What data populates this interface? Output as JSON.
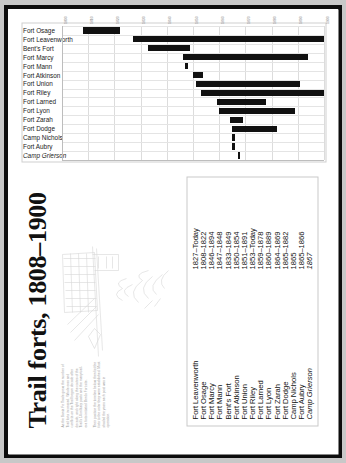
{
  "document": {
    "title": "Trail forts, 1808–1900",
    "blurb": [
      "As the Santa Fe Trade grew, the number of Trail forts increased. Whole eras and conflicts on the Trail began decade after decade, and right along the routes of the Trail's 14 military posts and the many trail-era forts initiated Bent's Fort site.",
      "Their position the timeline below, then list the forts to the order they were established. Most shaded the years each post was in operation."
    ]
  },
  "legend": {
    "rows": [
      {
        "name": "Fort Leavenworth",
        "dates": "1827–Today",
        "italic": false
      },
      {
        "name": "Fort Osage",
        "dates": "1808–1822",
        "italic": false
      },
      {
        "name": "Fort Marcy",
        "dates": "1846–1894",
        "italic": false
      },
      {
        "name": "Fort Mann",
        "dates": "1847–1848",
        "italic": false
      },
      {
        "name": "Bent's Fort",
        "dates": "1833–1849",
        "italic": false
      },
      {
        "name": "Fort Atkinson",
        "dates": "1850–1854",
        "italic": false
      },
      {
        "name": "Fort Union",
        "dates": "1851–1891",
        "italic": false
      },
      {
        "name": "Fort Riley",
        "dates": "1853–Today",
        "italic": false
      },
      {
        "name": "Fort Larned",
        "dates": "1859–1878",
        "italic": false
      },
      {
        "name": "Fort Lyon",
        "dates": "1860–1889",
        "italic": false
      },
      {
        "name": "Fort Zarah",
        "dates": "1864–1869",
        "italic": false
      },
      {
        "name": "Fort Dodge",
        "dates": "1865–1882",
        "italic": false
      },
      {
        "name": "Camp Nichols",
        "dates": "1865",
        "italic": false
      },
      {
        "name": "Fort Aubry",
        "dates": "1865–1866",
        "italic": false
      },
      {
        "name": "Camp Grierson",
        "dates": "1867",
        "italic": true
      }
    ]
  },
  "chart_data": {
    "type": "bar",
    "subtype": "gantt-range",
    "title": "Trail forts, 1808–1900",
    "xlabel": "",
    "ylabel": "",
    "xlim": [
      1800,
      1900
    ],
    "grid": true,
    "legend_position": "none",
    "xticks": [
      "1800",
      "1810",
      "1820",
      "1830",
      "1840",
      "1850",
      "1860",
      "1870",
      "1880",
      "1890",
      "1900"
    ],
    "categories": [
      "Fort Osage",
      "Fort Leavenworth",
      "Bent's Fort",
      "Fort Marcy",
      "Fort Mann",
      "Fort Atkinson",
      "Fort Union",
      "Fort Riley",
      "Fort Larned",
      "Fort Lyon",
      "Fort Zarah",
      "Fort Dodge",
      "Camp Nichols",
      "Fort Aubry",
      "Camp Grierson"
    ],
    "ranges": [
      {
        "label": "Fort Osage",
        "start": 1808,
        "end": 1822,
        "italic": false
      },
      {
        "label": "Fort Leavenworth",
        "start": 1827,
        "end": 1900,
        "italic": false
      },
      {
        "label": "Bent's Fort",
        "start": 1833,
        "end": 1849,
        "italic": false
      },
      {
        "label": "Fort Marcy",
        "start": 1846,
        "end": 1894,
        "italic": false
      },
      {
        "label": "Fort Mann",
        "start": 1847,
        "end": 1848,
        "italic": false
      },
      {
        "label": "Fort Atkinson",
        "start": 1850,
        "end": 1854,
        "italic": false
      },
      {
        "label": "Fort Union",
        "start": 1851,
        "end": 1891,
        "italic": false
      },
      {
        "label": "Fort Riley",
        "start": 1853,
        "end": 1900,
        "italic": false
      },
      {
        "label": "Fort Larned",
        "start": 1859,
        "end": 1878,
        "italic": false
      },
      {
        "label": "Fort Lyon",
        "start": 1860,
        "end": 1889,
        "italic": false
      },
      {
        "label": "Fort Zarah",
        "start": 1864,
        "end": 1869,
        "italic": false
      },
      {
        "label": "Fort Dodge",
        "start": 1865,
        "end": 1882,
        "italic": false
      },
      {
        "label": "Camp Nichols",
        "start": 1865,
        "end": 1866,
        "italic": false
      },
      {
        "label": "Fort Aubry",
        "start": 1865,
        "end": 1866,
        "italic": false
      },
      {
        "label": "Camp Grierson",
        "start": 1867,
        "end": 1868,
        "italic": true
      }
    ],
    "bar_color": "#111111",
    "grid_color": "#dcdcdc"
  }
}
